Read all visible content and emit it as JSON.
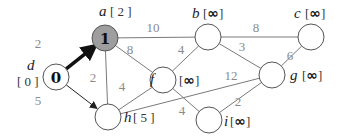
{
  "graph": {
    "nodes": [
      {
        "id": "a",
        "name": "a",
        "dist": "2",
        "inside": "1",
        "visited": true,
        "dist_is_inf": false
      },
      {
        "id": "b",
        "name": "b",
        "dist": "∞",
        "inside": "",
        "visited": false,
        "dist_is_inf": true
      },
      {
        "id": "c",
        "name": "c",
        "dist": "∞",
        "inside": "",
        "visited": false,
        "dist_is_inf": true
      },
      {
        "id": "d",
        "name": "d",
        "dist": "0",
        "inside": "0",
        "visited": false,
        "dist_is_inf": false
      },
      {
        "id": "f",
        "name": "f",
        "dist": "∞",
        "inside": "",
        "visited": false,
        "dist_is_inf": true
      },
      {
        "id": "g",
        "name": "g",
        "dist": "∞",
        "inside": "",
        "visited": false,
        "dist_is_inf": true
      },
      {
        "id": "h",
        "name": "h",
        "dist": "5",
        "inside": "",
        "visited": false,
        "dist_is_inf": false
      },
      {
        "id": "i",
        "name": "i",
        "dist": "∞",
        "inside": "",
        "visited": false,
        "dist_is_inf": true
      }
    ],
    "edges": [
      {
        "from": "d",
        "to": "a",
        "weight": "2",
        "style": "bold-arrow"
      },
      {
        "from": "d",
        "to": "h",
        "weight": "5",
        "style": "arrow"
      },
      {
        "from": "a",
        "to": "b",
        "weight": "10",
        "style": "plain"
      },
      {
        "from": "a",
        "to": "f",
        "weight": "8",
        "style": "plain"
      },
      {
        "from": "a",
        "to": "h",
        "weight": "2",
        "style": "plain"
      },
      {
        "from": "b",
        "to": "c",
        "weight": "8",
        "style": "plain"
      },
      {
        "from": "b",
        "to": "f",
        "weight": "4",
        "style": "plain"
      },
      {
        "from": "b",
        "to": "g",
        "weight": "3",
        "style": "plain"
      },
      {
        "from": "c",
        "to": "g",
        "weight": "6",
        "style": "plain"
      },
      {
        "from": "f",
        "to": "h",
        "weight": "4",
        "style": "plain"
      },
      {
        "from": "f",
        "to": "i",
        "weight": "4",
        "style": "plain"
      },
      {
        "from": "h",
        "to": "g",
        "weight": "12",
        "style": "plain"
      },
      {
        "from": "i",
        "to": "g",
        "weight": "2",
        "style": "plain"
      }
    ],
    "label_brackets": {
      "open": "[",
      "close": "]"
    }
  }
}
